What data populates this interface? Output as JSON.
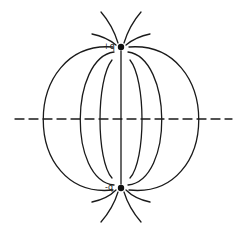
{
  "diagram": {
    "charges": [
      {
        "label": "+q",
        "x": 121,
        "y": 47
      },
      {
        "label": "-q",
        "x": 121,
        "y": 188
      }
    ],
    "axis": {
      "style": "dashed",
      "y": 119,
      "x1": 15,
      "x2": 232
    },
    "line_color": "#1a1a1a"
  }
}
